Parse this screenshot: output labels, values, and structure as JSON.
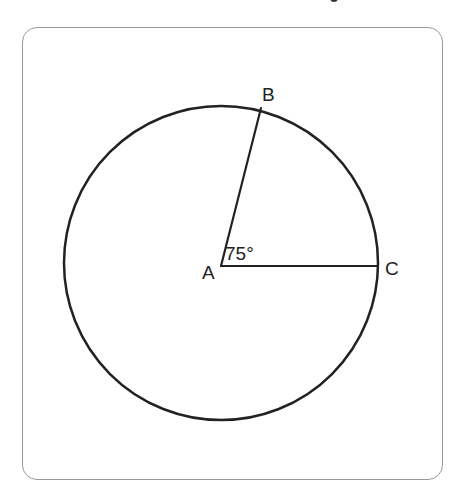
{
  "diagram": {
    "type": "circle-central-angle",
    "frame": {
      "x": 22,
      "y": 27,
      "width": 421,
      "height": 453,
      "corner_radius": 15,
      "border_color": "#9a9a9a"
    },
    "circle": {
      "cx": 221,
      "cy": 263,
      "r": 157,
      "stroke": "#222222",
      "stroke_width": 2.5
    },
    "points": [
      {
        "id": "A",
        "label": "A",
        "role": "center",
        "x": 221,
        "y": 266,
        "label_x": 202,
        "label_y": 279
      },
      {
        "id": "B",
        "label": "B",
        "role": "on-circle",
        "x": 261,
        "y": 108,
        "label_x": 262,
        "label_y": 101
      },
      {
        "id": "C",
        "label": "C",
        "role": "on-circle",
        "x": 378,
        "y": 266,
        "label_x": 385,
        "label_y": 275
      }
    ],
    "segments": [
      {
        "from": "A",
        "to": "B",
        "name": "radius-AB"
      },
      {
        "from": "A",
        "to": "C",
        "name": "radius-AC"
      }
    ],
    "angle": {
      "vertex": "A",
      "between": [
        "B",
        "C"
      ],
      "label": "75°",
      "degrees": 75,
      "label_x": 225,
      "label_y": 260
    }
  }
}
